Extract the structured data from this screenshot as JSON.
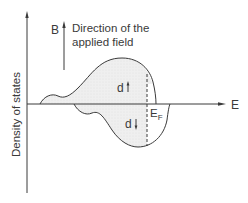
{
  "diagram": {
    "y_axis_label": "Density of states",
    "x_axis_label": "E",
    "field_symbol": "B",
    "field_caption_line1": "Direction of the",
    "field_caption_line2": "applied field",
    "upper_band_label": "d",
    "lower_band_label": "d",
    "fermi_label": "E",
    "fermi_subscript": "F",
    "colors": {
      "line": "#3a3a3a",
      "fill": "#ececec",
      "background": "#ffffff"
    }
  }
}
